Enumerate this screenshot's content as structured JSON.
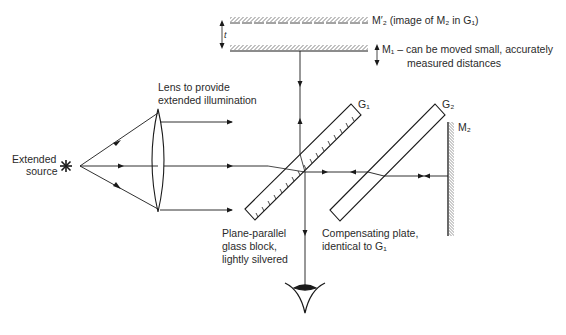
{
  "diagram": {
    "type": "michelson-interferometer",
    "labels": {
      "m2_prime": "M′₂ (image of M₂ in G₁)",
      "m1_line1": "M₁ – can be moved small, accurately",
      "m1_line2": "measured distances",
      "t_symbol": "t",
      "lens_line1": "Lens to provide",
      "lens_line2": "extended illumination",
      "source_line1": "Extended",
      "source_line2": "source",
      "g1": "G₁",
      "g2": "G₂",
      "m2": "M₂",
      "g1_desc_line1": "Plane-parallel",
      "g1_desc_line2": "glass block,",
      "g1_desc_line3": "lightly silvered",
      "g2_desc_line1": "Compensating plate,",
      "g2_desc_line2": "identical to G₁"
    },
    "colors": {
      "line": "#1a1a1a",
      "text": "#2a2a2a",
      "background": "#ffffff"
    }
  }
}
